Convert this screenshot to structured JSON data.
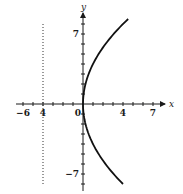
{
  "chart_data": {
    "type": "line",
    "title": "",
    "equation": "x = y^2/16",
    "xlabel": "x",
    "ylabel": "y",
    "xlim": [
      -6.5,
      8
    ],
    "ylim": [
      -8.5,
      9
    ],
    "grid": false,
    "legend": null,
    "x_tick_labels": [
      {
        "value": -6,
        "label": "−6"
      },
      {
        "value": -4,
        "label": "4"
      },
      {
        "value": 0,
        "label": "0"
      },
      {
        "value": 4,
        "label": "4"
      },
      {
        "value": 7,
        "label": "7"
      }
    ],
    "y_tick_labels": [
      {
        "value": 7,
        "label": "7"
      },
      {
        "value": -7,
        "label": "−7"
      }
    ],
    "x_minor_ticks": [
      -6,
      -5,
      -4,
      -3,
      -2,
      -1,
      1,
      2,
      3,
      4,
      5,
      6,
      7
    ],
    "y_minor_ticks": [
      -8,
      -7,
      -6,
      -5,
      -4,
      -3,
      -2,
      -1,
      1,
      2,
      3,
      4,
      5,
      6,
      7,
      8
    ],
    "series": [
      {
        "name": "parabola",
        "style": "solid",
        "color": "#111111",
        "points": [
          {
            "x": 4.0,
            "y": -8
          },
          {
            "x": 3.0625,
            "y": -7
          },
          {
            "x": 2.25,
            "y": -6
          },
          {
            "x": 1.5625,
            "y": -5
          },
          {
            "x": 1.0,
            "y": -4
          },
          {
            "x": 0.5625,
            "y": -3
          },
          {
            "x": 0.25,
            "y": -2
          },
          {
            "x": 0.0625,
            "y": -1
          },
          {
            "x": 0.0,
            "y": 0
          },
          {
            "x": 0.0625,
            "y": 1
          },
          {
            "x": 0.25,
            "y": 2
          },
          {
            "x": 0.5625,
            "y": 3
          },
          {
            "x": 1.0,
            "y": 4
          },
          {
            "x": 1.5625,
            "y": 5
          },
          {
            "x": 2.25,
            "y": 6
          },
          {
            "x": 3.0625,
            "y": 7
          },
          {
            "x": 4.0,
            "y": 8
          },
          {
            "x": 4.2,
            "y": 8.5
          }
        ]
      },
      {
        "name": "directrix",
        "style": "dotted",
        "color": "#333333",
        "points": [
          {
            "x": -4,
            "y": 8
          },
          {
            "x": -4,
            "y": -8
          }
        ]
      }
    ],
    "annotations": [
      {
        "text": "x",
        "role": "x-axis label"
      },
      {
        "text": "y",
        "role": "y-axis label"
      }
    ]
  }
}
